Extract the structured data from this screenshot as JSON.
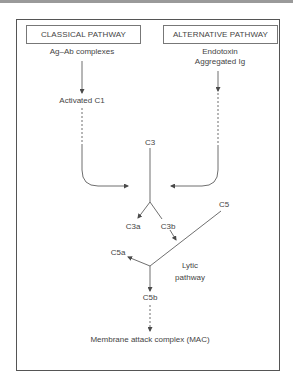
{
  "diagram": {
    "title_boxes": {
      "classical": "CLASSICAL PATHWAY",
      "alternative": "ALTERNATIVE PATHWAY"
    },
    "nodes": {
      "ag_ab": "Ag–Ab complexes",
      "activated_c1": "Activated C1",
      "endotoxin": "Endotoxin",
      "aggregated_ig": "Aggregated Ig",
      "c3": "C3",
      "c3a": "C3a",
      "c3b": "C3b",
      "c5": "C5",
      "c5a": "C5a",
      "lytic_1": "Lytic",
      "lytic_2": "pathway",
      "c5b": "C5b",
      "mac": "Membrane attack complex (MAC)"
    },
    "edges": [
      {
        "from": "Ag–Ab complexes",
        "to": "Activated C1",
        "style": "solid"
      },
      {
        "from": "Activated C1",
        "to": "C3 convergence",
        "style": "dashed-then-solid"
      },
      {
        "from": "Aggregated Ig",
        "to": "C3 convergence",
        "style": "solid-then-dashed"
      },
      {
        "from": "C3",
        "to": "C3a",
        "style": "solid"
      },
      {
        "from": "C3",
        "to": "C3b",
        "style": "solid"
      },
      {
        "from": "C5",
        "to": "C5a",
        "style": "solid"
      },
      {
        "from": "C5",
        "to": "C5b",
        "style": "solid"
      },
      {
        "from": "C5b",
        "to": "Membrane attack complex (MAC)",
        "style": "dashed"
      }
    ],
    "colors": {
      "line": "#4a4a4a",
      "text": "#444444",
      "frame": "#555555"
    }
  }
}
